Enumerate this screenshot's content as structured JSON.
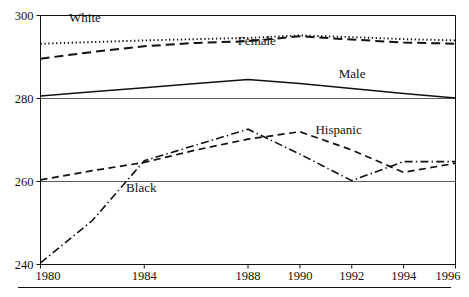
{
  "chart_data": {
    "type": "line",
    "title": "",
    "subtitle": "",
    "xlabel": "",
    "ylabel": "",
    "xlim": [
      1980,
      1996
    ],
    "ylim": [
      240,
      300
    ],
    "grid": true,
    "legend_position": "inline-annotations",
    "x_ticks": [
      "1980",
      "1984",
      "1988",
      "1990",
      "1992",
      "1994",
      "1996"
    ],
    "x_tick_values": [
      1980,
      1984,
      1988,
      1990,
      1992,
      1994,
      1996
    ],
    "y_ticks": [
      "240",
      "260",
      "280",
      "300"
    ],
    "y_tick_values": [
      240,
      260,
      280,
      300
    ],
    "x": [
      1980,
      1982,
      1984,
      1986,
      1988,
      1990,
      1992,
      1994,
      1996
    ],
    "series": [
      {
        "name": "White",
        "style": "dotted",
        "label": "White",
        "label_x": 1981.1,
        "label_y": 298.5,
        "values": [
          293.2,
          293.6,
          294.0,
          294.3,
          294.6,
          295.2,
          294.8,
          294.3,
          294.0
        ]
      },
      {
        "name": "Female",
        "style": "dashed-long",
        "label": "Female",
        "label_x": 1987.6,
        "label_y": 293.0,
        "values": [
          289.6,
          291.2,
          292.6,
          293.4,
          293.8,
          295.0,
          294.2,
          293.5,
          293.2
        ]
      },
      {
        "name": "Male",
        "style": "solid",
        "label": "Male",
        "label_x": 1991.5,
        "label_y": 285.0,
        "values": [
          280.6,
          281.6,
          282.6,
          283.6,
          284.6,
          283.6,
          282.4,
          281.2,
          280.1
        ]
      },
      {
        "name": "Hispanic",
        "style": "dashed-medium",
        "label": "Hispanic",
        "label_x": 1990.6,
        "label_y": 271.4,
        "values": [
          260.4,
          262.6,
          264.6,
          267.6,
          270.2,
          272.0,
          267.6,
          262.2,
          264.4
        ]
      },
      {
        "name": "Black",
        "style": "dash-dot",
        "label": "Black",
        "label_x": 1983.3,
        "label_y": 257.4,
        "values": [
          240.4,
          250.6,
          265.0,
          268.8,
          272.6,
          266.6,
          260.2,
          264.8,
          264.8
        ]
      }
    ]
  }
}
